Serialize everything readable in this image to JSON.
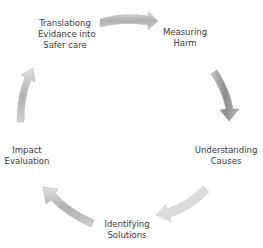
{
  "diagram": {
    "type": "cycle",
    "nodes": [
      {
        "id": "measuring",
        "lines": [
          "Measuring",
          "Harm"
        ]
      },
      {
        "id": "understanding",
        "lines": [
          "Understanding",
          "Causes"
        ]
      },
      {
        "id": "identifying",
        "lines": [
          "Identifying",
          "Solutions"
        ]
      },
      {
        "id": "impact",
        "lines": [
          "Impact",
          "Evaluation"
        ]
      },
      {
        "id": "translating",
        "lines": [
          "Translationg",
          "Evidance into",
          "Safer care"
        ]
      }
    ],
    "arrow_color": "#a8a8a8",
    "arrow_light_color": "#d6d6d6"
  }
}
